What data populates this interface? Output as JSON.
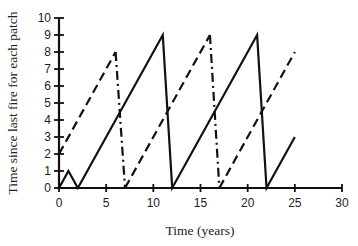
{
  "chart_data": {
    "type": "line",
    "title": "",
    "xlabel": "Time (years)",
    "ylabel": "Time since last fire for each patch",
    "xlim": [
      0,
      30
    ],
    "ylim": [
      0,
      10
    ],
    "xticks": [
      0,
      5,
      10,
      15,
      20,
      25,
      30
    ],
    "yticks": [
      0,
      1,
      2,
      3,
      4,
      5,
      6,
      7,
      8,
      9,
      10
    ],
    "grid": false,
    "legend": null,
    "series": [
      {
        "name": "Patch A (solid)",
        "style": "solid",
        "points": [
          [
            0,
            0
          ],
          [
            1,
            1
          ],
          [
            2,
            0
          ],
          [
            11,
            9
          ],
          [
            12,
            0
          ],
          [
            21,
            9
          ],
          [
            22,
            0
          ],
          [
            25,
            3
          ]
        ]
      },
      {
        "name": "Patch B (dashed)",
        "style": "dashed",
        "segments": [
          {
            "style": "dashed",
            "points": [
              [
                0,
                2
              ],
              [
                6,
                8
              ]
            ]
          },
          {
            "style": "dashdot",
            "points": [
              [
                6,
                8
              ],
              [
                7,
                0
              ]
            ]
          },
          {
            "style": "dashed",
            "points": [
              [
                7,
                0
              ],
              [
                16,
                9
              ]
            ]
          },
          {
            "style": "dashdot",
            "points": [
              [
                16,
                9
              ],
              [
                17,
                0
              ]
            ]
          },
          {
            "style": "dashed",
            "points": [
              [
                17,
                0
              ],
              [
                25,
                8
              ]
            ]
          }
        ]
      }
    ]
  },
  "colors": {
    "line": "#111111",
    "axis": "#111111"
  }
}
